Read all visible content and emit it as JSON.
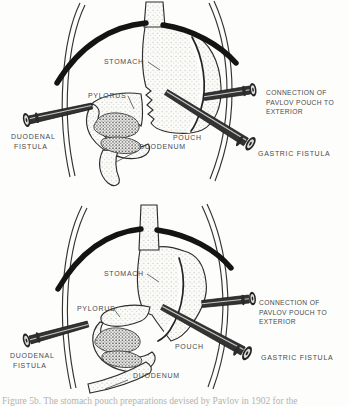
{
  "colors": {
    "paper": "#fdfdfc",
    "ink": "#262626",
    "label_text": "#4a4a4a",
    "stipple_dots": "#9a9a9a",
    "caption_text": "#b3b3ae"
  },
  "figure_top": {
    "labels": {
      "stomach": "STOMACH",
      "pylorus": "PYLORUS",
      "duodenal_fistula_line1": "DUODENAL",
      "duodenal_fistula_line2": "FISTULA",
      "duodenum": "DUODENUM",
      "pouch": "POUCH",
      "connection_line1": "CONNECTION OF",
      "connection_line2": "PAVLOV POUCH TO",
      "connection_line3": "EXTERIOR",
      "gastric_fistula": "GASTRIC FISTULA"
    }
  },
  "figure_bottom": {
    "labels": {
      "stomach": "STOMACH",
      "pylorus": "PYLORUS",
      "duodenal_fistula_line1": "DUODENAL",
      "duodenal_fistula_line2": "FISTULA",
      "duodenum": "DUODENUM",
      "pouch": "POUCH",
      "connection_line1": "CONNECTION OF",
      "connection_line2": "PAVLOV POUCH TO",
      "connection_line3": "EXTERIOR",
      "gastric_fistula": "GASTRIC FISTULA"
    }
  },
  "caption": {
    "text": "Figure 5b. The stomach pouch preparations devised by Pavlov in 1902 for the"
  }
}
